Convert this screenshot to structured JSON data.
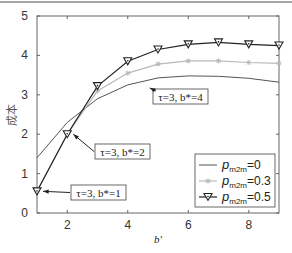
{
  "chart_data": {
    "type": "line",
    "title": "",
    "xlabel": "b'",
    "ylabel": "成本",
    "xlim": [
      1,
      9
    ],
    "ylim": [
      0,
      5
    ],
    "xticks": [
      2,
      4,
      6,
      8
    ],
    "yticks": [
      0,
      1,
      2,
      3,
      4,
      5
    ],
    "grid": false,
    "legend_position": "lower right",
    "x": [
      1,
      2,
      3,
      4,
      5,
      6,
      7,
      8,
      9
    ],
    "series": [
      {
        "name": "p_m2m = 0",
        "label_base": "p",
        "label_sub": "m2m",
        "label_val": "=0",
        "marker": "none",
        "color": "#555555",
        "width": 1,
        "values": [
          1.4,
          2.3,
          2.9,
          3.25,
          3.43,
          3.48,
          3.47,
          3.42,
          3.32
        ]
      },
      {
        "name": "p_m2m = 0.3",
        "label_base": "p",
        "label_sub": "m2m",
        "label_val": "=0.3",
        "marker": "star",
        "color": "#b8b8b8",
        "width": 1.2,
        "values": [
          0.55,
          2.0,
          3.1,
          3.55,
          3.78,
          3.86,
          3.86,
          3.82,
          3.8
        ]
      },
      {
        "name": "p_m2m = 0.5",
        "label_base": "p",
        "label_sub": "m2m",
        "label_val": "=0.5",
        "marker": "triangle-down",
        "color": "#222222",
        "width": 1.2,
        "values": [
          0.55,
          2.0,
          3.22,
          3.85,
          4.15,
          4.28,
          4.33,
          4.28,
          4.25
        ]
      }
    ],
    "annotations": [
      {
        "text": "τ=3, b*=1",
        "x": 1,
        "y": 0.55
      },
      {
        "text": "τ=3, b*=2",
        "x": 2,
        "y": 2.0
      },
      {
        "text": "τ=3, b*=4",
        "x": 4,
        "y": 3.25
      }
    ]
  }
}
